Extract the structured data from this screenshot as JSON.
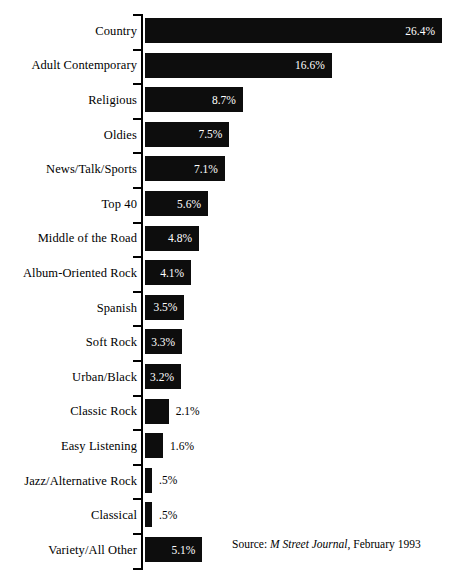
{
  "chart_data": {
    "type": "bar",
    "orientation": "horizontal",
    "title": "",
    "xlabel": "",
    "ylabel": "",
    "xlim": [
      0,
      26.4
    ],
    "grid": false,
    "legend": false,
    "value_suffix": "%",
    "categories": [
      "Country",
      "Adult Contemporary",
      "Religious",
      "Oldies",
      "News/Talk/Sports",
      "Top 40",
      "Middle of the Road",
      "Album-Oriented Rock",
      "Spanish",
      "Soft Rock",
      "Urban/Black",
      "Classic Rock",
      "Easy Listening",
      "Jazz/Alternative Rock",
      "Classical",
      "Variety/All Other"
    ],
    "values": [
      26.4,
      16.6,
      8.7,
      7.5,
      7.1,
      5.6,
      4.8,
      4.1,
      3.5,
      3.3,
      3.2,
      2.1,
      1.6,
      0.5,
      0.5,
      5.1
    ],
    "value_labels": [
      "26.4%",
      "16.6%",
      "8.7%",
      "7.5%",
      "7.1%",
      "5.6%",
      "4.8%",
      "4.1%",
      "3.5%",
      "3.3%",
      "3.2%",
      "2.1%",
      "1.6%",
      ".5%",
      ".5%",
      "5.1%"
    ],
    "label_placement": [
      "inside",
      "inside",
      "inside",
      "inside",
      "inside",
      "inside",
      "inside",
      "inside",
      "inside",
      "inside",
      "inside",
      "outside",
      "outside",
      "outside",
      "outside",
      "inside"
    ],
    "bar_color": "#0d0d0d",
    "background_color": "#ffffff",
    "inside_label_color": "#ffffff",
    "outside_label_color": "#000000"
  },
  "source": {
    "prefix": "Source:",
    "publication": "M Street Journal",
    "suffix": ", February 1993"
  }
}
